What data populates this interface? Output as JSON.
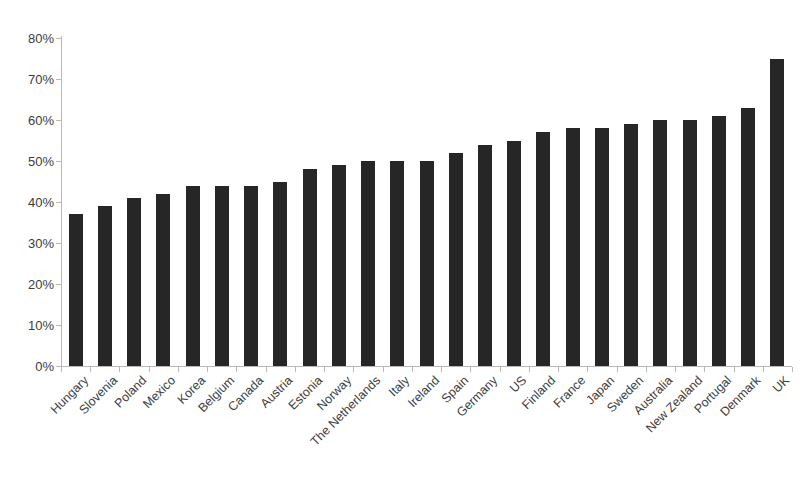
{
  "chart_data": {
    "type": "bar",
    "title": "",
    "subtitle": "",
    "xlabel": "",
    "ylabel": "",
    "ylim": [
      0,
      80
    ],
    "ytick_labels": [
      "0%",
      "10%",
      "20%",
      "30%",
      "40%",
      "50%",
      "60%",
      "70%",
      "80%"
    ],
    "ytick_values": [
      0,
      10,
      20,
      30,
      40,
      50,
      60,
      70,
      80
    ],
    "grid": false,
    "legend": false,
    "bar_color": "#262626",
    "axis_color": "#b9b9b9",
    "label_color": "#404040",
    "categories": [
      "Hungary",
      "Slovenia",
      "Poland",
      "Mexico",
      "Korea",
      "Belgium",
      "Canada",
      "Austria",
      "Estonia",
      "Norway",
      "The Netherlands",
      "Italy",
      "Ireland",
      "Spain",
      "Germany",
      "US",
      "Finland",
      "France",
      "Japan",
      "Sweden",
      "Australia",
      "New Zealand",
      "Portugal",
      "Denmark",
      "UK"
    ],
    "values": [
      37,
      39,
      41,
      42,
      44,
      44,
      44,
      45,
      48,
      49,
      50,
      50,
      50,
      52,
      54,
      55,
      57,
      58,
      58,
      59,
      60,
      60,
      61,
      63,
      75
    ]
  }
}
